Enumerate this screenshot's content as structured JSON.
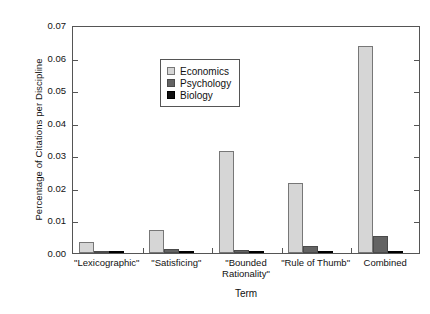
{
  "chart_data": {
    "type": "bar",
    "title": "",
    "xlabel": "Term",
    "ylabel": "Percentage of Citations per Discipline",
    "categories": [
      "\"Lexicographic\"",
      "\"Satisficing\"",
      "\"Bounded\nRationality\"",
      "\"Rule of Thumb\"",
      "Combined"
    ],
    "series": [
      {
        "name": "Economics",
        "color": "#d6d6d6",
        "values": [
          0.0034,
          0.0072,
          0.0312,
          0.0215,
          0.0636
        ]
      },
      {
        "name": "Psychology",
        "color": "#636363",
        "values": [
          0.0002,
          0.0012,
          0.0008,
          0.0023,
          0.0052
        ]
      },
      {
        "name": "Biology",
        "color": "#111111",
        "values": [
          2e-05,
          0.0002,
          0.0001,
          0.0003,
          0.0005
        ]
      }
    ],
    "ylim": [
      0.0,
      0.07
    ],
    "yticks": [
      0.0,
      0.01,
      0.02,
      0.03,
      0.04,
      0.05,
      0.06,
      0.07
    ],
    "ytick_labels": [
      "0.00",
      "0.01",
      "0.02",
      "0.03",
      "0.04",
      "0.05",
      "0.06",
      "0.07"
    ],
    "grid": false,
    "legend_position": "upper left"
  }
}
